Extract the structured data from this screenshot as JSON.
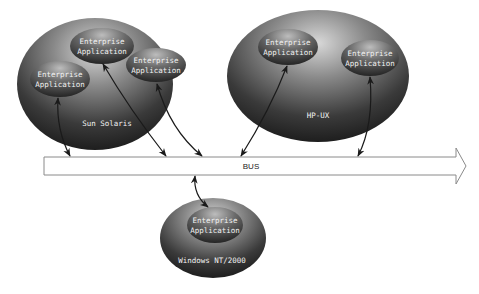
{
  "diagram": {
    "bus": {
      "label": "BUS"
    },
    "platforms": [
      {
        "id": "sun",
        "label": "Sun Solaris",
        "apps": [
          "Enterprise\nApplication",
          "Enterprise\nApplication",
          "Enterprise\nApplication"
        ]
      },
      {
        "id": "hpux",
        "label": "HP-UX",
        "apps": [
          "Enterprise\nApplication",
          "Enterprise\nApplication"
        ]
      },
      {
        "id": "win",
        "label": "Windows NT/2000",
        "apps": [
          "Enterprise\nApplication"
        ]
      }
    ],
    "app_label_line1": "Enterprise",
    "app_label_line2": "Application",
    "connections": [
      {
        "from": "sun.app1",
        "to": "bus",
        "bidirectional": true
      },
      {
        "from": "sun.app2",
        "to": "bus",
        "bidirectional": true
      },
      {
        "from": "sun.app3",
        "to": "bus",
        "bidirectional": true
      },
      {
        "from": "hpux.app1",
        "to": "bus",
        "bidirectional": true
      },
      {
        "from": "hpux.app2",
        "to": "bus",
        "bidirectional": true
      },
      {
        "from": "win.app1",
        "to": "bus",
        "bidirectional": true
      }
    ],
    "colors": {
      "ellipse_dark": "#2a2a2a",
      "ellipse_light": "#cfcfcf",
      "arrow": "#1a1a1a",
      "bus_stroke": "#888888"
    }
  }
}
